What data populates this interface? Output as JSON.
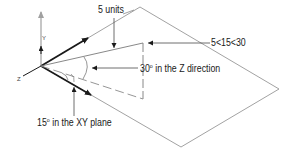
{
  "diagram": {
    "labels": {
      "units": "5 units",
      "coordinate": "5<15<30",
      "z_angle_deg": "30",
      "z_angle_text": " in the Z direction",
      "xy_angle_deg": "15",
      "xy_angle_text": " in the XY plane",
      "degree_symbol": "o"
    },
    "axes": {
      "y": "Y",
      "z": "Z"
    },
    "colors": {
      "line": "#7a7a7a",
      "dark": "#1a1a1a",
      "y_axis": "#a0a0a0",
      "text": "#1a1a1a"
    }
  }
}
